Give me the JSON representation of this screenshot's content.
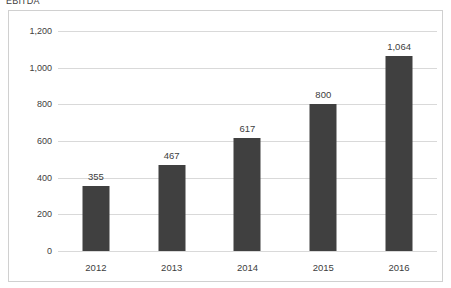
{
  "chart_data": {
    "type": "bar",
    "title": "EBITDA",
    "xlabel": "",
    "ylabel": "",
    "categories": [
      "2012",
      "2013",
      "2014",
      "2015",
      "2016"
    ],
    "values": [
      355,
      467,
      617,
      800,
      1064
    ],
    "value_labels": [
      "355",
      "467",
      "617",
      "800",
      "1,064"
    ],
    "ylim": [
      0,
      1200
    ],
    "yticks": [
      0,
      200,
      400,
      600,
      800,
      1000,
      1200
    ],
    "ytick_labels": [
      "0",
      "200",
      "400",
      "600",
      "800",
      "1,000",
      "1,200"
    ],
    "grid": true,
    "legend": false,
    "series": [
      {
        "name": "EBITDA",
        "values": [
          355,
          467,
          617,
          800,
          1064
        ]
      }
    ]
  },
  "style": {
    "bar_color": "#404040",
    "gridline_color": "#d9d9d9",
    "text_color": "#404040",
    "border_color": "#d0d0d0",
    "background_color": "#ffffff"
  }
}
